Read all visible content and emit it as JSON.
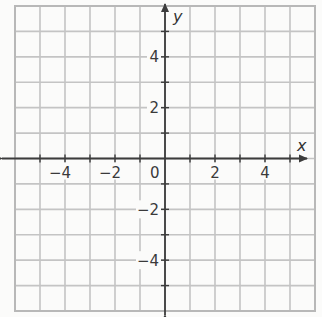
{
  "chart_data": {
    "type": "coordinate-grid",
    "title": "",
    "xlabel": "x",
    "ylabel": "y",
    "xlim": [
      -6,
      6
    ],
    "ylim": [
      -6,
      6
    ],
    "grid": true,
    "grid_step": 1,
    "x_ticks": [
      -6,
      -5,
      -4,
      -3,
      -2,
      -1,
      0,
      1,
      2,
      3,
      4,
      5,
      6
    ],
    "y_ticks": [
      -6,
      -5,
      -4,
      -3,
      -2,
      -1,
      0,
      1,
      2,
      3,
      4,
      5,
      6
    ],
    "x_tick_labels": [
      {
        "value": -4,
        "label": "−4"
      },
      {
        "value": -2,
        "label": "−2"
      },
      {
        "value": 2,
        "label": "2"
      },
      {
        "value": 4,
        "label": "4"
      }
    ],
    "y_tick_labels": [
      {
        "value": 4,
        "label": "4"
      },
      {
        "value": 2,
        "label": "2"
      },
      {
        "value": -2,
        "label": "−2"
      },
      {
        "value": -4,
        "label": "−4"
      }
    ],
    "origin_label": "0",
    "arrows": {
      "x_axis": "both",
      "y_axis": "both"
    },
    "series": [],
    "legend": null
  },
  "colors": {
    "grid": "#c4c4c4",
    "axis": "#3c3c3c",
    "text": "#3a3a3a",
    "background": "#fbfbfa"
  }
}
